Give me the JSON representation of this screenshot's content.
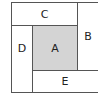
{
  "diagram": {
    "regions": [
      {
        "id": "A",
        "label": "A",
        "fill": "#d4d4d4"
      },
      {
        "id": "B",
        "label": "B",
        "fill": "#ffffff"
      },
      {
        "id": "C",
        "label": "C",
        "fill": "#ffffff"
      },
      {
        "id": "D",
        "label": "D",
        "fill": "#ffffff"
      },
      {
        "id": "E",
        "label": "E",
        "fill": "#ffffff"
      }
    ]
  }
}
